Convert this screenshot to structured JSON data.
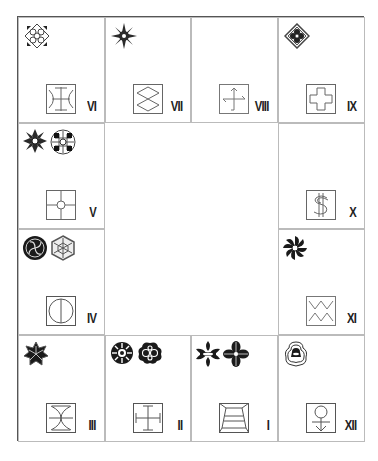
{
  "board": {
    "title": "",
    "cells": [
      {
        "id": "VI",
        "numeral": "VI",
        "row": 0,
        "col": 0,
        "emblems": [
          "diamond-lattice-crest"
        ],
        "glyph": "crescents-pillar-glyph"
      },
      {
        "id": "VII",
        "numeral": "VII",
        "row": 0,
        "col": 1,
        "emblems": [
          "starburst-crest"
        ],
        "glyph": "double-diamond-glyph"
      },
      {
        "id": "VIII",
        "numeral": "VIII",
        "row": 0,
        "col": 2,
        "emblems": [],
        "glyph": "crossed-arrows-glyph"
      },
      {
        "id": "IX",
        "numeral": "IX",
        "row": 0,
        "col": 3,
        "emblems": [
          "flower-diamond-crest"
        ],
        "glyph": "cross-glyph"
      },
      {
        "id": "V",
        "numeral": "V",
        "row": 1,
        "col": 0,
        "emblems": [
          "snowflake-crest",
          "grid-circle-crest"
        ],
        "glyph": "quartered-circle-glyph"
      },
      {
        "id": "X",
        "numeral": "X",
        "row": 1,
        "col": 3,
        "emblems": [],
        "glyph": "dollar-glyph"
      },
      {
        "id": "IV",
        "numeral": "IV",
        "row": 2,
        "col": 0,
        "emblems": [
          "swirl-circle-crest",
          "hexagon-crest"
        ],
        "glyph": "split-circle-glyph"
      },
      {
        "id": "XI",
        "numeral": "XI",
        "row": 2,
        "col": 3,
        "emblems": [
          "pinwheel-crest"
        ],
        "glyph": "zigzag-glyph"
      },
      {
        "id": "III",
        "numeral": "III",
        "row": 3,
        "col": 0,
        "emblems": [
          "star-flower-crest"
        ],
        "glyph": "fish-cross-glyph"
      },
      {
        "id": "II",
        "numeral": "II",
        "row": 3,
        "col": 1,
        "emblems": [
          "wheel-crest",
          "quatrefoil-crest"
        ],
        "glyph": "bracket-cross-glyph"
      },
      {
        "id": "I",
        "numeral": "I",
        "row": 3,
        "col": 2,
        "emblems": [
          "fleur-crest",
          "leaf-flower-crest"
        ],
        "glyph": "trapezoid-frame-glyph"
      },
      {
        "id": "XII",
        "numeral": "XII",
        "row": 3,
        "col": 3,
        "emblems": [
          "bell-crest"
        ],
        "glyph": "anchor-circle-glyph"
      }
    ]
  },
  "colors": {
    "ink": "#222222",
    "line": "#555555",
    "grid": "#bbbbbb",
    "glyph": "#666666",
    "paper": "#ffffff"
  }
}
